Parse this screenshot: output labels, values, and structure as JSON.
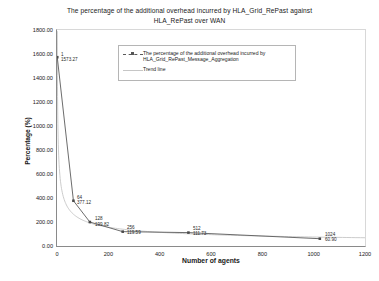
{
  "chart_data": {
    "type": "line",
    "title": "The percentage of the additional overhead incurred by HLA_Grid_RePast  against HLA_RePast over WAN",
    "title_line1": "The percentage of the additional overhead incurred by HLA_Grid_RePast  against",
    "title_line2": "HLA_RePast over WAN",
    "xlabel": "Number of agents",
    "ylabel": "Percentage (%)",
    "xlim": [
      0,
      1200
    ],
    "ylim": [
      0,
      1800
    ],
    "xticks": [
      "0",
      "200",
      "400",
      "600",
      "800",
      "1000",
      "1200"
    ],
    "yticks": [
      "0.00",
      "200.00",
      "400.00",
      "600.00",
      "800.00",
      "1000.00",
      "1200.00",
      "1400.00",
      "1600.00",
      "1800.00"
    ],
    "grid": false,
    "legend_position": "upper-center",
    "x": [
      1,
      64,
      128,
      256,
      512,
      1024
    ],
    "values": [
      1573.27,
      377.12,
      199.82,
      119.59,
      111.73,
      60.9
    ],
    "point_labels": [
      {
        "agents": "1",
        "value": "1573.27"
      },
      {
        "agents": "64",
        "value": "377.12"
      },
      {
        "agents": "128",
        "value": "199.82"
      },
      {
        "agents": "256",
        "value": "119.59"
      },
      {
        "agents": "512",
        "value": "111.73"
      },
      {
        "agents": "1024",
        "value": "60.90"
      }
    ],
    "series": [
      {
        "name": "The percentage of the additional overhead incurred by HLA_Grid_RePast_Message_Aggregation",
        "name_line1": "The percentage of the additional overhead incurred by",
        "name_line2": "HLA_Grid_RePast_Message_Aggregation",
        "color": "#4a4a4a",
        "x": [
          1,
          64,
          128,
          256,
          512,
          1024
        ],
        "values": [
          1573.27,
          377.12,
          199.82,
          119.59,
          111.73,
          60.9
        ]
      },
      {
        "name": "Trend line",
        "color": "#c0c0c0",
        "type": "power-trend"
      }
    ]
  },
  "legend": {
    "entries": [
      {
        "label_line1": "The percentage of the additional overhead incurred by",
        "label_line2": "HLA_Grid_RePast_Message_Aggregation"
      },
      {
        "label_line1": "Trend line",
        "label_line2": ""
      }
    ]
  },
  "colors": {
    "series": "#4a4a4a",
    "trend": "#c4c4c4",
    "axis": "#8a8a8a",
    "text": "#1a1a1a",
    "background": "#ffffff"
  }
}
